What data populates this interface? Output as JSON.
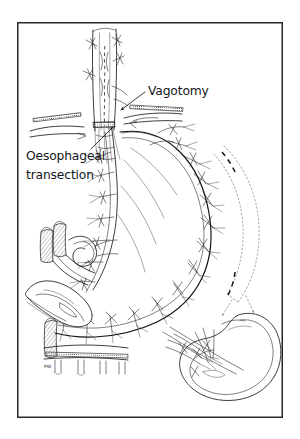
{
  "figure": {
    "kind": "surgical-line-drawing",
    "background_color": "#ffffff",
    "ink_color": "#1b1c20",
    "ghost_color": "#7d7f86",
    "frame": {
      "x": 17,
      "y": 22,
      "width": 266,
      "height": 396,
      "stroke_color": "#26272c",
      "stroke_width": 1.5
    },
    "annotations": [
      {
        "id": "vagotomy",
        "label": "Vagotomy",
        "text_x": 148,
        "text_y": 95,
        "leader": {
          "x1": 145,
          "y1": 92,
          "x2": 119,
          "y2": 111,
          "arrow": true
        }
      },
      {
        "id": "oesophageal-transection",
        "label_line1": "Oesophageal",
        "label_line2": "transection",
        "text_x": 26,
        "text_y": 160,
        "text_y2": 179,
        "leader": {
          "x1": 93,
          "y1": 148,
          "x2": 112,
          "y2": 127,
          "arrow": true
        }
      }
    ],
    "signature": {
      "label": "PW",
      "x": 46,
      "y": 367
    },
    "structures": [
      {
        "name": "oesophagus",
        "note": "vertical tube, upper centre"
      },
      {
        "name": "vagus-nerve",
        "note": "dashed line inside oesophagus"
      },
      {
        "name": "transection-line",
        "note": "stippled band across oesophagus"
      },
      {
        "name": "stomach",
        "note": "large curved body, centre"
      },
      {
        "name": "lesser-curvature",
        "note": "left margin of stomach"
      },
      {
        "name": "greater-curvature",
        "note": "right and lower margin of stomach"
      },
      {
        "name": "ligated-vessels",
        "note": "tied suture bundles along curvatures"
      },
      {
        "name": "left-gastric-vessels",
        "note": "hatched vessels at left"
      },
      {
        "name": "pancreas",
        "note": "elongated body lower left"
      },
      {
        "name": "spleen-ghost-outline",
        "note": "dotted curves, right side"
      },
      {
        "name": "detached-spleen",
        "note": "kidney-shaped organ, lower right"
      },
      {
        "name": "splenic-hilum-vessels",
        "note": "ligated stumps on spleen"
      }
    ]
  }
}
